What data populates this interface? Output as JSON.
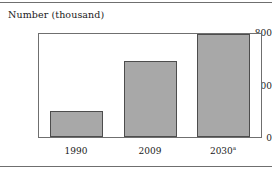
{
  "chart_data": {
    "type": "bar",
    "title": "Number (thousand)",
    "xlabel": "",
    "ylabel": "Number (thousand)",
    "categories": [
      "1990",
      "2009",
      "2030"
    ],
    "category_notes": [
      "",
      "",
      "a"
    ],
    "values": [
      205,
      590,
      800
    ],
    "ylim": [
      0,
      800
    ],
    "yticks": [
      0,
      400,
      800
    ],
    "ytick_labels": [
      "0",
      "400",
      "800"
    ],
    "grid": false,
    "legend": false,
    "bar_color": "#a8a8a8",
    "bar_border_color": "#4d4d4d",
    "axis_color": "#6f6f6f"
  },
  "figure": {
    "title": "Number (thousand)",
    "yticks": {
      "t0": "0",
      "t400": "400",
      "t800": "800"
    },
    "xticks": {
      "x0": "1990",
      "x1": "2009",
      "x2": "2030",
      "x2_sup": "a"
    }
  }
}
